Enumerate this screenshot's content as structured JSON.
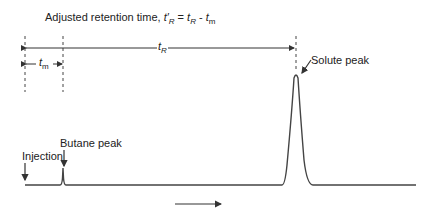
{
  "title": {
    "prefix": "Adjusted retention time, ",
    "t_prime_R": "t′",
    "R": "R",
    "eq": " = ",
    "t": "t",
    "minus": " - ",
    "tm": "t",
    "m": "m"
  },
  "labels": {
    "t_R": "t",
    "t_R_sub": "R",
    "t_m": "t",
    "t_m_sub": "m",
    "solute_peak": "Solute peak",
    "butane_peak": "Butane peak",
    "injection": "Injection"
  },
  "colors": {
    "line": "#333333",
    "dashed": "#444444"
  }
}
